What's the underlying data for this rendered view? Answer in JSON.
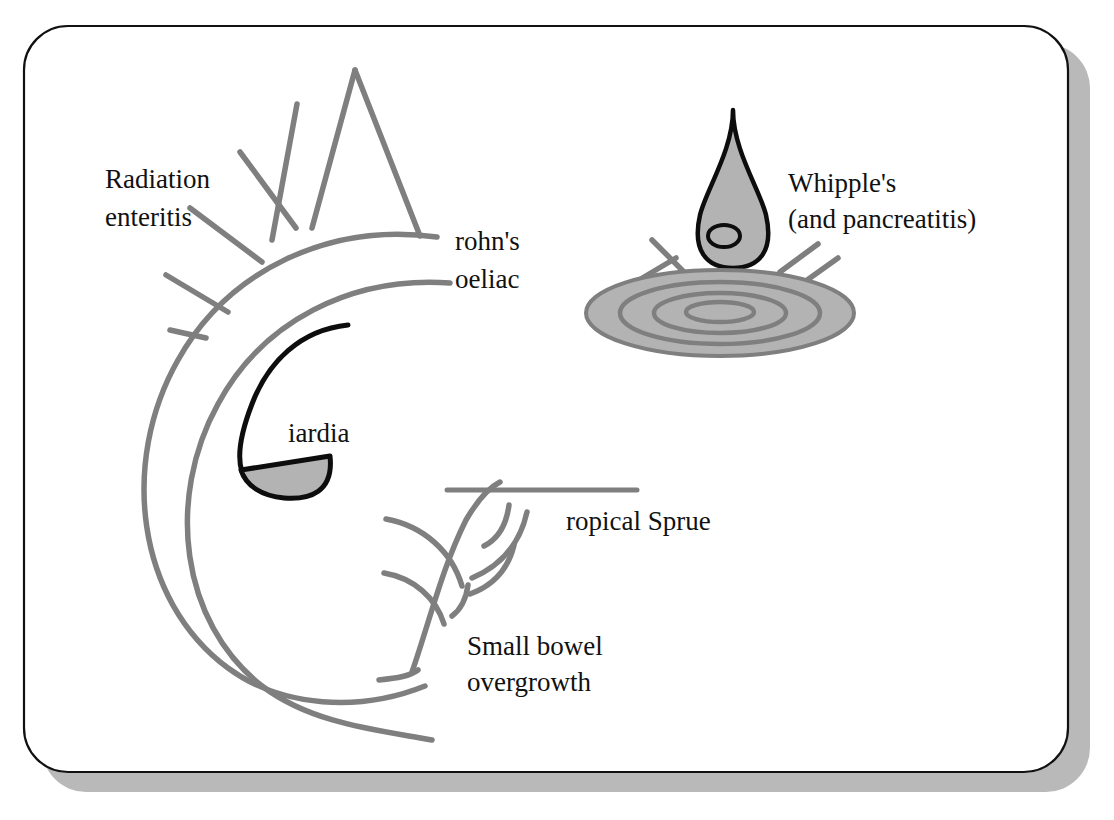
{
  "figure": {
    "background_color": "#ffffff",
    "card": {
      "fill": "#ffffff",
      "border_color": "#111111",
      "shadow_color": "#b9b9b9"
    },
    "palette": {
      "gray_stroke": "#7f7f7f",
      "gray_fill": "#b3b3b3",
      "black_stroke": "#0d0d0d",
      "text_color": "#111111"
    }
  },
  "labels": {
    "radiation": {
      "line1": "Radiation",
      "line2": "enteritis"
    },
    "crohns": {
      "line1": "rohn's",
      "line2": "oeliac"
    },
    "whipples": {
      "line1": "Whipple's",
      "line2": "(and pancreatitis)"
    },
    "giardia": {
      "line1": "iardia"
    },
    "tropical_sprue": {
      "line1": "ropical Sprue"
    },
    "small_bowel": {
      "line1": "Small bowel",
      "line2": "overgrowth"
    }
  },
  "icons": {
    "radiation_sunburst": "sunburst-rays-icon",
    "bowel_arcs": "concentric-arcs-icon",
    "giardia_g": "giardia-g-icon",
    "water_droplet": "water-droplet-icon",
    "ripple_puddle": "ripple-puddle-icon",
    "splash_lines": "splash-lines-icon",
    "villi_tree": "branching-villi-tree-icon",
    "sprue_bar": "horizontal-bar-icon"
  }
}
